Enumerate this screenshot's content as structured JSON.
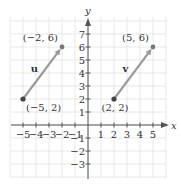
{
  "diagram": {
    "type": "coordinate-plane-vectors",
    "axes": {
      "x_label": "x",
      "y_label": "y",
      "x_ticks": [
        {
          "value": -5,
          "label": "−5"
        },
        {
          "value": -4,
          "label": "−4"
        },
        {
          "value": -3,
          "label": "−3"
        },
        {
          "value": -2,
          "label": "−2"
        },
        {
          "value": -1,
          "label": "−1"
        },
        {
          "value": 1,
          "label": "1"
        },
        {
          "value": 2,
          "label": "2"
        },
        {
          "value": 3,
          "label": "3"
        },
        {
          "value": 4,
          "label": "4"
        },
        {
          "value": 5,
          "label": "5"
        }
      ],
      "y_ticks": [
        {
          "value": 7,
          "label": "7"
        },
        {
          "value": 6,
          "label": "6"
        },
        {
          "value": 5,
          "label": "5"
        },
        {
          "value": 4,
          "label": "4"
        },
        {
          "value": 3,
          "label": "3"
        },
        {
          "value": 2,
          "label": "2"
        },
        {
          "value": 1,
          "label": "1"
        },
        {
          "value": -1,
          "label": "−1"
        },
        {
          "value": -2,
          "label": "−2"
        },
        {
          "value": -3,
          "label": "−3"
        }
      ]
    },
    "vectors": [
      {
        "name": "u",
        "start": {
          "x": -5,
          "y": 2,
          "label": "(−5, 2)"
        },
        "end": {
          "x": -2,
          "y": 6,
          "label": "(−2, 6)"
        }
      },
      {
        "name": "v",
        "start": {
          "x": 2,
          "y": 2,
          "label": "(2, 2)"
        },
        "end": {
          "x": 5,
          "y": 6,
          "label": "(5, 6)"
        }
      }
    ],
    "colors": {
      "grid": "#e2e2e2",
      "axis": "#555555",
      "vector": "#9a9a9a",
      "start_point": "#444444",
      "end_point": "#777777",
      "text": "#333333"
    }
  }
}
